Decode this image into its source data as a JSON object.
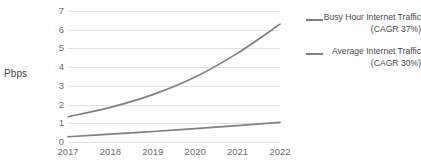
{
  "chart_data": {
    "type": "line",
    "title": "",
    "xlabel": "",
    "ylabel": "Pbps",
    "categories": [
      "2017",
      "2018",
      "2019",
      "2020",
      "2021",
      "2022"
    ],
    "x": [
      2017,
      2018,
      2019,
      2020,
      2021,
      2022
    ],
    "ylim": [
      0,
      7
    ],
    "y_ticks": [
      0,
      1,
      2,
      3,
      4,
      5,
      6,
      7
    ],
    "grid": true,
    "legend_position": "right",
    "series": [
      {
        "name": "Busy Hour Internet Traffic (CAGR 37%)",
        "color": "#808080",
        "values": [
          1.35,
          1.85,
          2.53,
          3.47,
          4.75,
          6.3
        ]
      },
      {
        "name": "Average Internet Traffic (CAGR 30%)",
        "color": "#808080",
        "values": [
          0.28,
          0.42,
          0.56,
          0.72,
          0.88,
          1.05
        ]
      }
    ]
  },
  "axis": {
    "y_title": "Pbps",
    "y_tick_labels": [
      "7",
      "6",
      "5",
      "4",
      "3",
      "2",
      "1",
      "0"
    ],
    "x_tick_labels": [
      "2017",
      "2018",
      "2019",
      "2020",
      "2021",
      "2022"
    ]
  },
  "legend": {
    "entries": [
      {
        "label": "Busy Hour Internet Traffic (CAGR 37%)"
      },
      {
        "label": "Average Internet Traffic (CAGR 30%)"
      }
    ]
  },
  "colors": {
    "series_line": "#808080",
    "gridline": "#e2e2e2",
    "tick_text": "#6b6b6b",
    "legend_text": "#4a4a4a"
  }
}
